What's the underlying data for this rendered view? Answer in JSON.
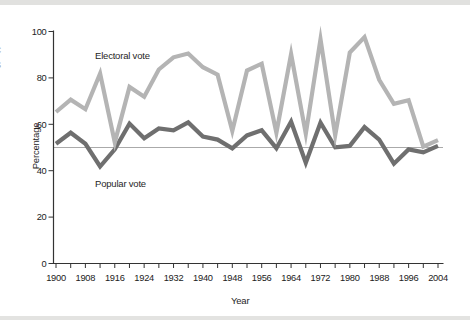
{
  "figure": {
    "background": "#ffffff",
    "top_band_color": "#e1e1df",
    "bottom_band_color": "#e3e3e1",
    "edge_fragments": [
      "c",
      "s"
    ]
  },
  "colors": {
    "axis": "#333333",
    "tick_text": "#212121",
    "reference_line": "#aaaaaa",
    "electoral_line": "#b4b4b4",
    "popular_line": "#6f6f6f"
  },
  "chart_data": {
    "type": "line",
    "title": "",
    "xlabel": "Year",
    "ylabel": "Percentage",
    "grid": "off",
    "legend": "inline-annotations",
    "x_years": [
      1900,
      1904,
      1908,
      1912,
      1916,
      1920,
      1924,
      1928,
      1932,
      1936,
      1940,
      1944,
      1948,
      1952,
      1956,
      1960,
      1964,
      1968,
      1972,
      1976,
      1980,
      1984,
      1988,
      1992,
      1996,
      2000,
      2004
    ],
    "x_axis": {
      "range": [
        1900,
        2004
      ],
      "minor_tick_step_years": 4,
      "tick_labels": [
        "1900",
        "1908",
        "1916",
        "1924",
        "1932",
        "1940",
        "1948",
        "1956",
        "1964",
        "1972",
        "1980",
        "1988",
        "1996",
        "2004"
      ]
    },
    "y_axis": {
      "range": [
        0,
        100
      ],
      "ticks": [
        "0",
        "20",
        "40",
        "60",
        "80",
        "100"
      ]
    },
    "reference_line": {
      "value": 50
    },
    "series": [
      {
        "name": "Electoral vote",
        "color": "#b4b4b4",
        "values": [
          65.3,
          70.6,
          66.5,
          81.9,
          52.2,
          76.1,
          71.9,
          83.6,
          88.9,
          90.5,
          84.6,
          81.4,
          57.1,
          83.2,
          86.1,
          56.4,
          90.3,
          55.9,
          96.7,
          55.2,
          90.9,
          97.6,
          79.2,
          68.8,
          70.4,
          50.4,
          53.2
        ]
      },
      {
        "name": "Popular vote",
        "color": "#6f6f6f",
        "values": [
          51.6,
          56.4,
          51.6,
          41.8,
          49.2,
          60.3,
          54.0,
          58.2,
          57.4,
          60.8,
          54.7,
          53.4,
          49.6,
          55.2,
          57.4,
          49.7,
          61.1,
          43.4,
          60.7,
          50.1,
          50.7,
          58.8,
          53.4,
          43.0,
          49.2,
          47.9,
          50.7
        ]
      }
    ],
    "annotations": [
      {
        "text": "Electoral vote",
        "series": "Electoral vote"
      },
      {
        "text": "Popular vote",
        "series": "Popular vote"
      }
    ]
  }
}
